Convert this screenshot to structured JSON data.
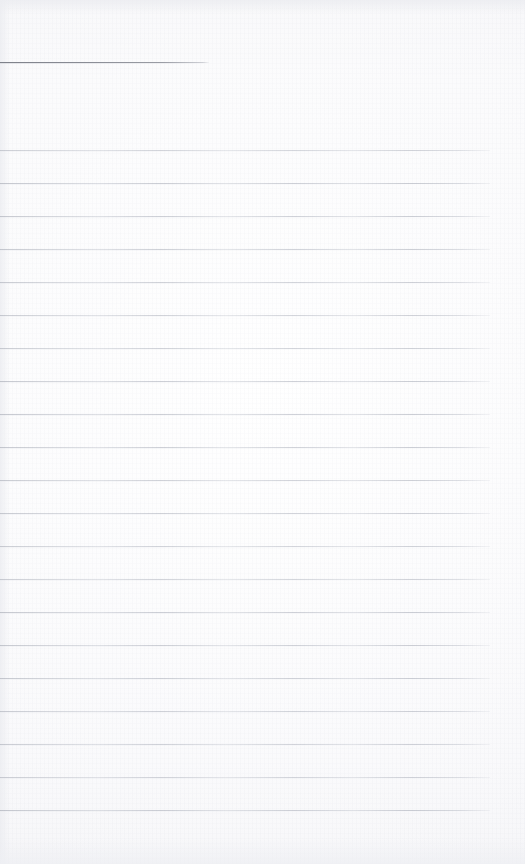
{
  "document": {
    "kind": "scanned-ruled-notebook-page",
    "width": 525,
    "height": 864,
    "background_color": "#fbfbfc",
    "content_text": "",
    "heading_rule": {
      "x": 0,
      "y": 62,
      "width": 209,
      "thickness": 1,
      "color": "#7e818a"
    },
    "ruled_lines": {
      "count": 21,
      "first_y": 150,
      "spacing": 33.05,
      "start_x": 0,
      "end_x": 490,
      "thickness": 1,
      "color": "#aeb2bd",
      "y_positions": [
        150,
        183,
        216,
        249,
        282,
        315,
        348,
        381,
        414,
        447,
        480,
        513,
        546,
        579,
        612,
        645,
        678,
        711,
        744,
        777,
        810
      ]
    },
    "margins": {
      "top_blank_height": 150,
      "right_blank_width": 35,
      "bottom_blank_height": 54,
      "left_blank_width": 0
    }
  }
}
